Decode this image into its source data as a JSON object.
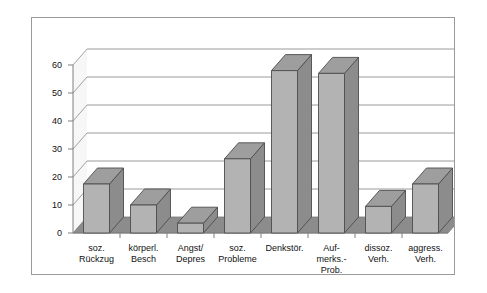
{
  "chart_data": {
    "type": "bar",
    "title": "",
    "subtitle": "",
    "xlabel": "",
    "ylabel": "",
    "style": "3d-column",
    "grid": true,
    "legend": false,
    "legend_position": "none",
    "ylim": [
      0,
      60
    ],
    "ytick_step": 10,
    "ytick_labels": [
      "0",
      "10",
      "20",
      "30",
      "40",
      "50",
      "60"
    ],
    "ytick_values": [
      0,
      10,
      20,
      30,
      40,
      50,
      60
    ],
    "categories": [
      "soz.\nRückzug",
      "körperl.\nBesch",
      "Angst/\nDepres",
      "soz.\nProbleme",
      "Denkstör.",
      "Auf-\nmerks.-\nProb.",
      "dissoz.\nVerh.",
      "aggress.\nVerh."
    ],
    "values": [
      17.5,
      10,
      3.5,
      26.5,
      58,
      57,
      9.5,
      17.5
    ],
    "colors": {
      "bar_front": "#b3b3b3",
      "bar_side": "#8c8c8c",
      "bar_top": "#9e9e9e",
      "bar_outline": "#4d4d4d",
      "floor": "#8c8c8c",
      "wall": "#f2f2f2",
      "gridline": "#808080",
      "axis": "#808080",
      "frame": "#9a9a9a",
      "background": "#ffffff",
      "text": "#111111"
    }
  }
}
